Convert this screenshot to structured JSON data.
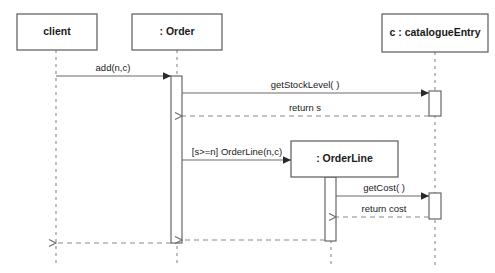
{
  "diagram": {
    "type": "uml-sequence-diagram",
    "title": "",
    "canvas": {
      "width": 495,
      "height": 273,
      "background": "#ffffff"
    },
    "colors": {
      "box_stroke": "#5a5a5a",
      "lifeline": "#8a8a8a",
      "message": "#6a6a6a",
      "text": "#1a1a1a",
      "background": "#ffffff"
    },
    "participants": [
      {
        "id": "client",
        "label": "client",
        "box": {
          "x": 17,
          "y": 14,
          "w": 80,
          "h": 36
        },
        "lifeline_x": 56,
        "lifeline_top": 50,
        "lifeline_bottom": 266,
        "created_at_start": true
      },
      {
        "id": "order",
        "label": ": Order",
        "box": {
          "x": 132,
          "y": 14,
          "w": 90,
          "h": 36
        },
        "lifeline_x": 177,
        "lifeline_top": 50,
        "lifeline_bottom": 266,
        "created_at_start": true
      },
      {
        "id": "orderline",
        "label": ": OrderLine",
        "box": {
          "x": 291,
          "y": 141,
          "w": 107,
          "h": 36
        },
        "lifeline_x": 331,
        "lifeline_top": 177,
        "lifeline_bottom": 266,
        "created_at_start": false
      },
      {
        "id": "catalogueentry",
        "label": "c : catalogueEntry",
        "box": {
          "x": 382,
          "y": 14,
          "w": 106,
          "h": 38
        },
        "lifeline_x": 435,
        "lifeline_top": 52,
        "lifeline_bottom": 266,
        "created_at_start": true
      }
    ],
    "activations": [
      {
        "id": "act-order",
        "participant": "order",
        "x": 171,
        "y": 76,
        "w": 11,
        "h": 167
      },
      {
        "id": "act-catalogue-1",
        "participant": "catalogueentry",
        "x": 429,
        "y": 91,
        "w": 12,
        "h": 25
      },
      {
        "id": "act-catalogue-2",
        "participant": "catalogueentry",
        "x": 429,
        "y": 193,
        "w": 12,
        "h": 26
      },
      {
        "id": "act-orderline",
        "participant": "orderline",
        "x": 325,
        "y": 177,
        "w": 11,
        "h": 64
      }
    ],
    "messages": [
      {
        "id": "msg-add",
        "label": "add(n,c)",
        "kind": "call",
        "style": "solid",
        "from_x": 56,
        "to_x": 171,
        "y": 76,
        "label_x": 113,
        "label_y": 71
      },
      {
        "id": "msg-getstocklevel",
        "label": "getStockLevel( )",
        "kind": "call",
        "style": "solid",
        "from_x": 182,
        "to_x": 429,
        "y": 93,
        "label_x": 305,
        "label_y": 88
      },
      {
        "id": "msg-return-s",
        "label": "return s",
        "kind": "return",
        "style": "dashed",
        "from_x": 429,
        "to_x": 182,
        "y": 116,
        "label_x": 305,
        "label_y": 111
      },
      {
        "id": "msg-create-orderline",
        "label": "[s>=n] OrderLine(n,c)",
        "kind": "create",
        "style": "solid",
        "from_x": 182,
        "to_x": 291,
        "y": 160,
        "label_x": 237,
        "label_y": 155
      },
      {
        "id": "msg-getcost",
        "label": "getCost( )",
        "kind": "call",
        "style": "solid",
        "from_x": 336,
        "to_x": 429,
        "y": 196,
        "label_x": 384,
        "label_y": 191
      },
      {
        "id": "msg-return-cost",
        "label": "return cost",
        "kind": "return",
        "style": "dashed",
        "from_x": 429,
        "to_x": 336,
        "y": 217,
        "label_x": 384,
        "label_y": 212
      },
      {
        "id": "msg-return-orderline",
        "label": "",
        "kind": "return",
        "style": "dashed",
        "from_x": 325,
        "to_x": 182,
        "y": 240,
        "label_x": 0,
        "label_y": 0
      },
      {
        "id": "msg-return-client",
        "label": "",
        "kind": "return",
        "style": "dashed",
        "from_x": 171,
        "to_x": 56,
        "y": 243,
        "label_x": 0,
        "label_y": 0
      }
    ]
  }
}
